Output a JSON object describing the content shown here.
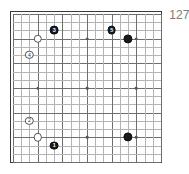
{
  "diagram": {
    "kind": "go-board-diagram",
    "corner_label": "127",
    "board": {
      "size": 19,
      "left": 12,
      "top": 13,
      "spacing": 8.22,
      "line_color": "#b4b4b4",
      "major_line_color": "#6e6e6e",
      "border_color": "#3a3a3a",
      "background": "#ffffff",
      "star_color": "#555555",
      "major_every": 3,
      "star_points": [
        [
          3,
          3
        ],
        [
          9,
          3
        ],
        [
          15,
          3
        ],
        [
          3,
          9
        ],
        [
          9,
          9
        ],
        [
          15,
          9
        ],
        [
          3,
          15
        ],
        [
          9,
          15
        ],
        [
          15,
          15
        ]
      ]
    },
    "stones": [
      {
        "id": "stone-3-black",
        "col": 5,
        "row": 2,
        "color": "black",
        "label": "3",
        "radius": 4.4
      },
      {
        "id": "stone-white-a",
        "col": 3,
        "row": 3,
        "color": "white",
        "label": "",
        "radius": 4.2
      },
      {
        "id": "stone-4-white",
        "col": 2,
        "row": 5,
        "color": "white",
        "label": "4",
        "radius": 4.2
      },
      {
        "id": "stone-5-black",
        "col": 12,
        "row": 2,
        "color": "black",
        "label": "5",
        "radius": 4.4
      },
      {
        "id": "stone-black-b",
        "col": 14,
        "row": 3,
        "color": "black",
        "label": "",
        "radius": 4.6
      },
      {
        "id": "stone-2-white",
        "col": 2,
        "row": 13,
        "color": "white",
        "label": "2",
        "radius": 4.2
      },
      {
        "id": "stone-white-c",
        "col": 3,
        "row": 15,
        "color": "white",
        "label": "",
        "radius": 4.2
      },
      {
        "id": "stone-1-black",
        "col": 5,
        "row": 16,
        "color": "black",
        "label": "1",
        "radius": 4.4
      },
      {
        "id": "stone-black-d",
        "col": 14,
        "row": 15,
        "color": "black",
        "label": "",
        "radius": 4.6
      }
    ]
  }
}
